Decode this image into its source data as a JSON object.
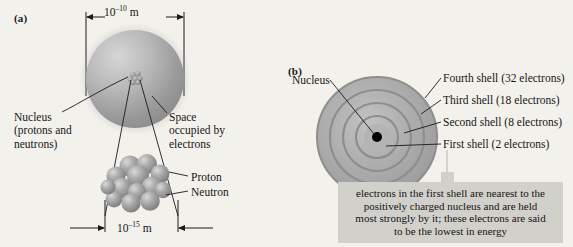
{
  "figure": {
    "background_color": "#f3f1ec",
    "panel_a_letter": "(a)",
    "panel_b_letter": "(b)"
  },
  "panel_a": {
    "dimension_atom": "10–10 m",
    "dimension_atom_base": "10",
    "dimension_atom_exponent": "–10",
    "dimension_atom_unit": " m",
    "dimension_nucleus_base": "10",
    "dimension_nucleus_exponent": "–15",
    "dimension_nucleus_unit": " m",
    "label_nucleus": "Nucleus\n(protons and\nneutrons)",
    "label_space": "Space\noccupied by\nelectrons",
    "label_proton": "Proton",
    "label_neutron": "Neutron",
    "atom_sphere_color": "#9d9d9d",
    "nucleon_color": "#9a9a9a"
  },
  "panel_b": {
    "label_nucleus": "Nucleus",
    "shells": [
      {
        "label": "Fourth shell (32 electrons)"
      },
      {
        "label": "Third shell (18 electrons)"
      },
      {
        "label": "Second shell (8 electrons)"
      },
      {
        "label": "First shell (2 electrons)"
      }
    ],
    "nucleus_dot_color": "#000000",
    "shell_color": "#a8a8a8",
    "callout": {
      "background_color": "#d2d0cb",
      "line1": "electrons in the first shell are nearest to the",
      "line2": "positively charged nucleus and are held",
      "line3": "most strongly by it; these electrons are said",
      "line4": "to be the lowest in energy"
    }
  }
}
